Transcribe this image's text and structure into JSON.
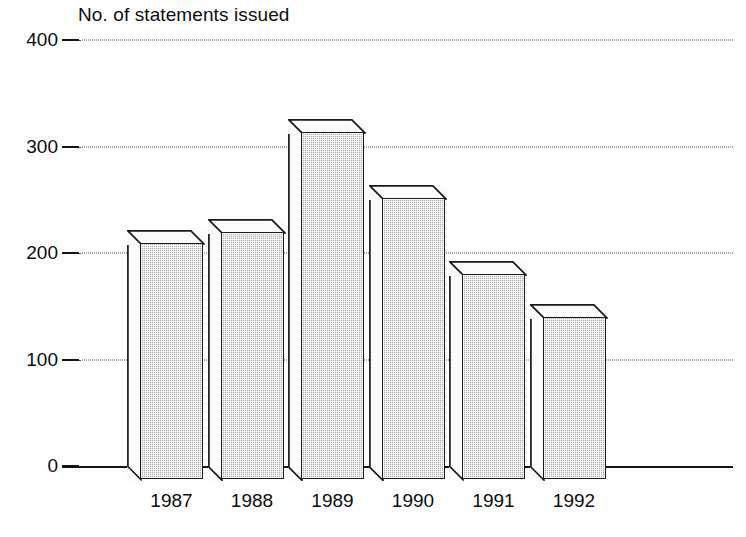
{
  "chart_data": {
    "type": "bar",
    "title": "No. of statements issued",
    "subtitle": "",
    "xlabel": "",
    "ylabel": "",
    "categories": [
      "1987",
      "1988",
      "1989",
      "1990",
      "1991",
      "1992"
    ],
    "values": [
      209,
      220,
      314,
      252,
      180,
      140
    ],
    "series": [
      {
        "name": "No. of statements issued",
        "values": [
          209,
          220,
          314,
          252,
          180,
          140
        ]
      }
    ],
    "ylim": [
      0,
      400
    ],
    "yticks": [
      0,
      100,
      200,
      300,
      400
    ],
    "ytick_labels": [
      "0",
      "100",
      "200",
      "300",
      "400"
    ],
    "grid": "horizontal-dotted",
    "legend": "none",
    "style": "3d-isometric-bars",
    "bar_fill_color": "#a8a8a8",
    "bar_outline_color": "#1a1a1a",
    "bar_top_color": "#fbfbfb",
    "background_color": "#ffffff",
    "text_color": "#0d0d0d",
    "annotations": []
  },
  "axes": {
    "y_ticks": [
      {
        "label": "400",
        "value": 400
      },
      {
        "label": "300",
        "value": 300
      },
      {
        "label": "200",
        "value": 200
      },
      {
        "label": "100",
        "value": 100
      },
      {
        "label": "0",
        "value": 0
      }
    ],
    "x_ticks": [
      {
        "label": "1987"
      },
      {
        "label": "1988"
      },
      {
        "label": "1989"
      },
      {
        "label": "1990"
      },
      {
        "label": "1991"
      },
      {
        "label": "1992"
      }
    ]
  },
  "bars": [
    {
      "category": "1987",
      "value": 209
    },
    {
      "category": "1988",
      "value": 220
    },
    {
      "category": "1989",
      "value": 314
    },
    {
      "category": "1990",
      "value": 252
    },
    {
      "category": "1991",
      "value": 180
    },
    {
      "category": "1992",
      "value": 140
    }
  ]
}
